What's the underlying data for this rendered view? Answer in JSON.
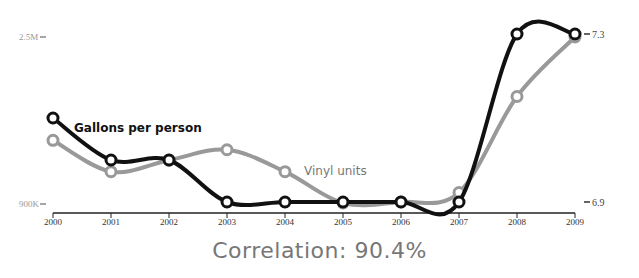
{
  "chart_data": {
    "type": "line",
    "title": "",
    "x": [
      "2000",
      "2001",
      "2002",
      "2003",
      "2004",
      "2005",
      "2006",
      "2007",
      "2008",
      "2009"
    ],
    "series": [
      {
        "name": "Gallons per person",
        "axis": "right",
        "color": "#111111",
        "values": [
          7.1,
          7.0,
          7.0,
          6.9,
          6.9,
          6.9,
          6.9,
          6.9,
          7.3,
          7.3
        ]
      },
      {
        "name": "Vinyl units",
        "axis": "left",
        "color": "#999999",
        "values": [
          1510000,
          1210000,
          1320000,
          1420000,
          1210000,
          910000,
          920000,
          1010000,
          1930000,
          2500000
        ]
      }
    ],
    "left_axis": {
      "ticks": [
        {
          "label": "2.5M",
          "value": 2500000
        },
        {
          "label": "900K",
          "value": 900000
        }
      ],
      "range": [
        900000,
        2500000
      ]
    },
    "right_axis": {
      "ticks": [
        {
          "label": "7.3",
          "value": 7.3
        },
        {
          "label": "6.9",
          "value": 6.9
        }
      ],
      "range": [
        6.9,
        7.3
      ]
    },
    "xlabel": "",
    "grid": false,
    "legend": "inline labels"
  },
  "labels": {
    "left_top": "2.5M",
    "left_bottom": "900K",
    "right_top": "7.3",
    "right_bottom": "6.9",
    "series_black": "Gallons per person",
    "series_gray": "Vinyl units",
    "correlation": "Correlation: 90.4%"
  }
}
